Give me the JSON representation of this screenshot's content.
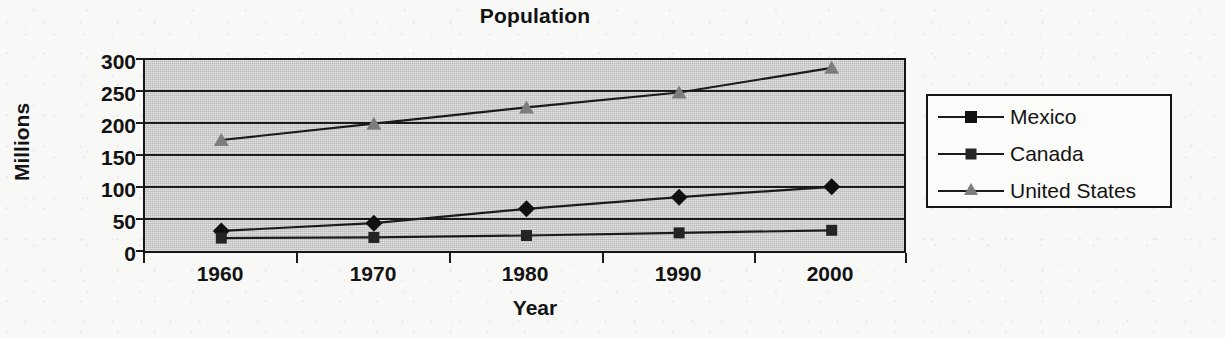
{
  "chart_data": {
    "type": "line",
    "title": "Population",
    "xlabel": "Year",
    "ylabel": "Millions",
    "categories": [
      "1960",
      "1970",
      "1980",
      "1990",
      "2000"
    ],
    "yticks": [
      "0",
      "50",
      "100",
      "150",
      "200",
      "250",
      "300"
    ],
    "ylim": [
      0,
      300
    ],
    "grid": true,
    "legend_position": "right",
    "plot_background": "#c9c9c9",
    "series": [
      {
        "name": "Mexico",
        "marker": "diamond",
        "color": "#101010",
        "values": [
          37,
          49,
          71,
          89,
          105
        ]
      },
      {
        "name": "Canada",
        "marker": "square",
        "color": "#242424",
        "values": [
          26,
          27,
          30,
          34,
          38
        ]
      },
      {
        "name": "United States",
        "marker": "triangle",
        "color": "#7d7d7d",
        "values": [
          177,
          202,
          227,
          250,
          288
        ]
      }
    ]
  }
}
